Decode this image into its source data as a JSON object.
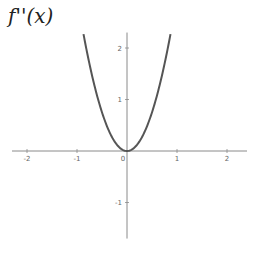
{
  "chart_data": {
    "type": "line",
    "title": "f''(x)",
    "function": "3x^2",
    "xlabel": "",
    "ylabel": "",
    "xlim": [
      -2.3,
      2.4
    ],
    "ylim": [
      -1.7,
      2.3
    ],
    "x_ticks": [
      -2,
      -1,
      0,
      1,
      2
    ],
    "y_ticks": [
      -1,
      1,
      2
    ],
    "x_tick_labels": [
      "-2",
      "-1",
      "0",
      "1",
      "2"
    ],
    "y_tick_labels": [
      "-1",
      "1",
      "2"
    ],
    "grid": false,
    "series": [
      {
        "name": "f''(x)",
        "x": [
          -0.87,
          -0.8,
          -0.7,
          -0.6,
          -0.5,
          -0.4,
          -0.3,
          -0.2,
          -0.1,
          0,
          0.1,
          0.2,
          0.3,
          0.4,
          0.5,
          0.6,
          0.7,
          0.8,
          0.87
        ],
        "values": [
          2.27,
          1.92,
          1.47,
          1.08,
          0.75,
          0.48,
          0.27,
          0.12,
          0.03,
          0,
          0.03,
          0.12,
          0.27,
          0.48,
          0.75,
          1.08,
          1.47,
          1.92,
          2.27
        ],
        "color": "#555555"
      }
    ]
  },
  "colors": {
    "curve": "#555555",
    "axis": "#8a8a8a",
    "tick_label": "#666666"
  }
}
